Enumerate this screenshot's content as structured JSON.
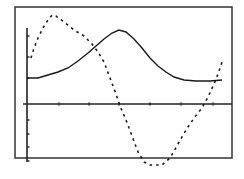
{
  "chart_data": {
    "type": "line",
    "title": "",
    "xlabel": "",
    "ylabel": "",
    "grid": false,
    "legend": "none",
    "frame": {
      "left": 15,
      "top": 7,
      "right": 232,
      "bottom": 158
    },
    "axes": {
      "x_axis_y": 104,
      "y_axis_x": 27,
      "y_axis_top": 28,
      "y_axis_bottom": 162,
      "x_ticks": [
        59,
        89,
        119,
        150,
        181,
        213
      ],
      "y_ticks": [
        36,
        57,
        78,
        120,
        134,
        147,
        161
      ]
    },
    "series": [
      {
        "name": "solid-curve",
        "style": "solid",
        "color": "#1a1a1a",
        "points": [
          [
            27,
            78
          ],
          [
            38,
            78
          ],
          [
            48,
            75
          ],
          [
            58,
            72
          ],
          [
            68,
            68
          ],
          [
            78,
            61
          ],
          [
            88,
            53
          ],
          [
            96,
            46
          ],
          [
            104,
            39
          ],
          [
            112,
            33
          ],
          [
            119,
            30
          ],
          [
            126,
            32
          ],
          [
            134,
            39
          ],
          [
            142,
            48
          ],
          [
            150,
            58
          ],
          [
            158,
            66
          ],
          [
            166,
            72
          ],
          [
            174,
            77
          ],
          [
            184,
            80
          ],
          [
            196,
            81
          ],
          [
            210,
            81
          ],
          [
            222,
            80
          ]
        ]
      },
      {
        "name": "dashed-curve",
        "style": "dashed",
        "color": "#1a1a1a",
        "points": [
          [
            31,
            58
          ],
          [
            34,
            48
          ],
          [
            38,
            38
          ],
          [
            43,
            28
          ],
          [
            48,
            20
          ],
          [
            52,
            15
          ],
          [
            56,
            16
          ],
          [
            64,
            22
          ],
          [
            74,
            30
          ],
          [
            84,
            36
          ],
          [
            92,
            44
          ],
          [
            98,
            52
          ],
          [
            104,
            62
          ],
          [
            110,
            78
          ],
          [
            116,
            94
          ],
          [
            120,
            106
          ],
          [
            126,
            120
          ],
          [
            132,
            136
          ],
          [
            138,
            152
          ],
          [
            144,
            162
          ],
          [
            150,
            165
          ],
          [
            162,
            165
          ],
          [
            170,
            158
          ],
          [
            178,
            144
          ],
          [
            186,
            130
          ],
          [
            194,
            118
          ],
          [
            202,
            108
          ],
          [
            208,
            97
          ],
          [
            214,
            84
          ],
          [
            218,
            74
          ],
          [
            222,
            62
          ]
        ]
      }
    ]
  }
}
